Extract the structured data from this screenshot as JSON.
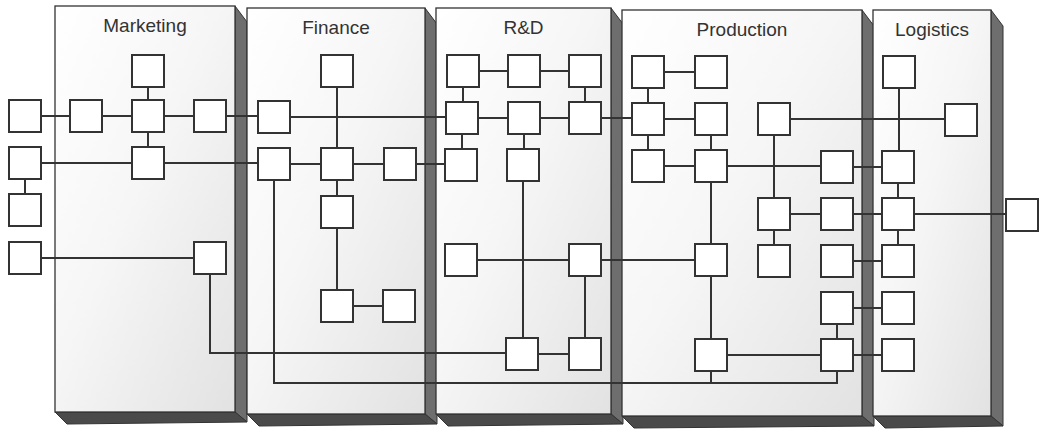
{
  "diagram": {
    "departments": [
      {
        "id": "marketing",
        "label": "Marketing",
        "x": 55,
        "y": 6,
        "w": 180,
        "h": 406
      },
      {
        "id": "finance",
        "label": "Finance",
        "x": 247,
        "y": 8,
        "w": 178,
        "h": 406
      },
      {
        "id": "rd",
        "label": "R&D",
        "x": 436,
        "y": 8,
        "w": 175,
        "h": 406
      },
      {
        "id": "production",
        "label": "Production",
        "x": 622,
        "y": 10,
        "w": 240,
        "h": 406
      },
      {
        "id": "logistics",
        "label": "Logistics",
        "x": 873,
        "y": 10,
        "w": 118,
        "h": 406
      }
    ],
    "node_size": 32,
    "nodes": [
      {
        "id": "m1",
        "cx": 148,
        "cy": 71
      },
      {
        "id": "x1",
        "cx": 25,
        "cy": 116
      },
      {
        "id": "m2",
        "cx": 86,
        "cy": 116
      },
      {
        "id": "m3",
        "cx": 148,
        "cy": 116
      },
      {
        "id": "m4",
        "cx": 210,
        "cy": 116
      },
      {
        "id": "x2",
        "cx": 25,
        "cy": 163
      },
      {
        "id": "m5",
        "cx": 148,
        "cy": 163
      },
      {
        "id": "x3",
        "cx": 25,
        "cy": 210
      },
      {
        "id": "x4",
        "cx": 25,
        "cy": 258
      },
      {
        "id": "m6",
        "cx": 210,
        "cy": 258
      },
      {
        "id": "f1",
        "cx": 337,
        "cy": 71
      },
      {
        "id": "f2",
        "cx": 274,
        "cy": 117
      },
      {
        "id": "f3",
        "cx": 274,
        "cy": 164
      },
      {
        "id": "f4",
        "cx": 337,
        "cy": 164
      },
      {
        "id": "f5",
        "cx": 400,
        "cy": 164
      },
      {
        "id": "f6",
        "cx": 337,
        "cy": 212
      },
      {
        "id": "f7",
        "cx": 337,
        "cy": 306
      },
      {
        "id": "f8",
        "cx": 399,
        "cy": 306
      },
      {
        "id": "r1",
        "cx": 463,
        "cy": 71
      },
      {
        "id": "r2",
        "cx": 524,
        "cy": 71
      },
      {
        "id": "r3",
        "cx": 585,
        "cy": 71
      },
      {
        "id": "r4",
        "cx": 462,
        "cy": 118
      },
      {
        "id": "r5",
        "cx": 524,
        "cy": 118
      },
      {
        "id": "r6",
        "cx": 585,
        "cy": 118
      },
      {
        "id": "r7",
        "cx": 461,
        "cy": 165
      },
      {
        "id": "r8",
        "cx": 523,
        "cy": 165
      },
      {
        "id": "r9",
        "cx": 461,
        "cy": 260
      },
      {
        "id": "r10",
        "cx": 585,
        "cy": 260
      },
      {
        "id": "r11",
        "cx": 522,
        "cy": 354
      },
      {
        "id": "r12",
        "cx": 585,
        "cy": 354
      },
      {
        "id": "p1",
        "cx": 648,
        "cy": 72
      },
      {
        "id": "p2",
        "cx": 711,
        "cy": 72
      },
      {
        "id": "p3",
        "cx": 648,
        "cy": 119
      },
      {
        "id": "p4",
        "cx": 711,
        "cy": 119
      },
      {
        "id": "p5",
        "cx": 774,
        "cy": 119
      },
      {
        "id": "p6",
        "cx": 648,
        "cy": 166
      },
      {
        "id": "p7",
        "cx": 711,
        "cy": 166
      },
      {
        "id": "p8",
        "cx": 837,
        "cy": 167
      },
      {
        "id": "p9",
        "cx": 774,
        "cy": 214
      },
      {
        "id": "p10",
        "cx": 837,
        "cy": 214
      },
      {
        "id": "p11",
        "cx": 711,
        "cy": 260
      },
      {
        "id": "p12",
        "cx": 774,
        "cy": 261
      },
      {
        "id": "p13",
        "cx": 837,
        "cy": 261
      },
      {
        "id": "p14",
        "cx": 837,
        "cy": 308
      },
      {
        "id": "p15",
        "cx": 711,
        "cy": 355
      },
      {
        "id": "p16",
        "cx": 837,
        "cy": 355
      },
      {
        "id": "l1",
        "cx": 899,
        "cy": 72
      },
      {
        "id": "l2",
        "cx": 961,
        "cy": 120
      },
      {
        "id": "l3",
        "cx": 898,
        "cy": 167
      },
      {
        "id": "l4",
        "cx": 898,
        "cy": 214
      },
      {
        "id": "l5",
        "cx": 898,
        "cy": 261
      },
      {
        "id": "l6",
        "cx": 898,
        "cy": 308
      },
      {
        "id": "l7",
        "cx": 898,
        "cy": 355
      },
      {
        "id": "x5",
        "cx": 1022,
        "cy": 215
      }
    ],
    "edges": [
      "M41,116 L70,116",
      "M102,116 L132,116",
      "M164,116 L194,116",
      "M226,116 L258,116",
      "M148,87 L148,100",
      "M148,132 L148,147",
      "M41,163 L132,163",
      "M164,163 L258,163",
      "M25,179 L25,194",
      "M41,258 L194,258",
      "M210,274 L210,353 L506,353",
      "M290,117 L446,117",
      "M337,87 L337,148",
      "M290,164 L321,164",
      "M353,164 L384,164",
      "M416,164 L445,164",
      "M337,180 L337,196",
      "M337,228 L337,290",
      "M353,306 L383,306",
      "M274,180 L274,383 L837,383 L837,371",
      "M479,71 L508,71",
      "M540,71 L569,71",
      "M463,87 L463,102",
      "M585,87 L585,102",
      "M478,118 L508,118",
      "M540,118 L569,118",
      "M601,118 L632,118",
      "M462,134 L462,149",
      "M524,134 L524,149",
      "M523,181 L523,338",
      "M477,260 L569,260",
      "M601,260 L695,260",
      "M585,276 L585,338",
      "M538,354 L569,354",
      "M664,72 L695,72",
      "M648,88 L648,103",
      "M648,135 L648,150",
      "M664,119 L695,119",
      "M711,135 L711,150",
      "M664,166 L695,166",
      "M727,166 L821,166",
      "M711,182 L711,244",
      "M711,276 L711,339",
      "M711,371 L711,383",
      "M790,119 L945,119",
      "M774,135 L774,198",
      "M774,230 L774,245",
      "M790,214 L821,214",
      "M727,355 L821,355",
      "M837,324 L837,339",
      "M853,167 L882,167",
      "M853,214 L882,214",
      "M853,261 L882,261",
      "M853,308 L882,308",
      "M853,355 L882,355",
      "M899,88 L899,151",
      "M898,183 L898,198",
      "M898,230 L898,245",
      "M914,214 L1006,214"
    ]
  }
}
